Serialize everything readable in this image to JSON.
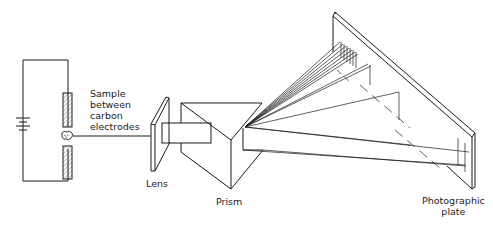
{
  "diagram": {
    "labels": {
      "sample": "Sample\nbetween\ncarbon\nelectrodes",
      "lens": "Lens",
      "prism": "Prism",
      "plate": "Photographic\nplate"
    },
    "components": [
      "battery-circuit",
      "carbon-electrodes",
      "sample",
      "lens",
      "collimator",
      "prism",
      "light-rays",
      "photographic-plate"
    ],
    "colors": {
      "line": "#1a1a1a",
      "background": "#ffffff"
    }
  }
}
